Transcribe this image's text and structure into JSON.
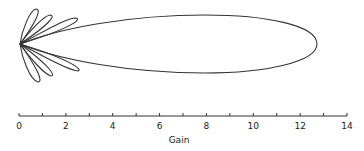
{
  "diagram": {
    "type": "polar-radiation-pattern",
    "main_lobe": {
      "max_gain": 12.8,
      "direction": "right"
    },
    "side_lobes_upper": 3,
    "side_lobes_lower": 3,
    "stroke_color": "#333333"
  },
  "axis": {
    "label": "Gain",
    "min": 0,
    "max": 14,
    "tick_labels": [
      "0",
      "2",
      "4",
      "6",
      "8",
      "10",
      "12",
      "14"
    ],
    "minor_ticks": 14
  }
}
